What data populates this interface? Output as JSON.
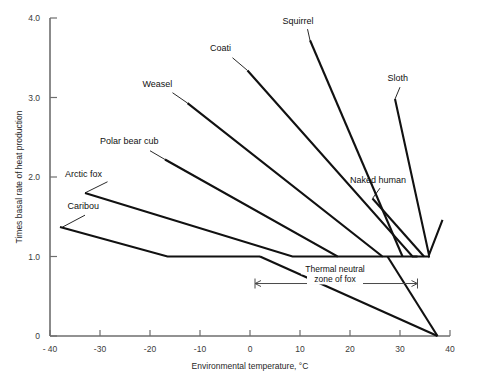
{
  "chart_data": {
    "type": "line",
    "title": "",
    "xlabel": "Environmental temperature, °C",
    "ylabel": "Times basal rate of heat production",
    "xlim": [
      -40,
      40
    ],
    "ylim": [
      0,
      4.0
    ],
    "xticks": [
      -40,
      -30,
      -20,
      -10,
      0,
      10,
      20,
      30,
      40
    ],
    "xticklabels": [
      "- 40",
      "-30",
      "-20",
      "-10",
      "0",
      "10",
      "20",
      "30",
      "40"
    ],
    "yticks": [
      0,
      1.0,
      2.0,
      3.0,
      4.0
    ],
    "yticklabels": [
      "0",
      "1.0",
      "2.0",
      "3.0",
      "4.0"
    ],
    "grid": false,
    "legend": "inline-labels",
    "series": [
      {
        "name": "Caribou",
        "label": "Caribou",
        "label_x": -36.5,
        "label_y": 1.6,
        "leader": [
          [
            -33.0,
            1.52
          ],
          [
            -37.5,
            1.37
          ]
        ],
        "points": [
          [
            -38.0,
            1.37
          ],
          [
            -16.5,
            1.0
          ],
          [
            2.0,
            1.0
          ]
        ]
      },
      {
        "name": "Arctic fox",
        "label": "Arctic fox",
        "label_x": -37.0,
        "label_y": 2.0,
        "leader": [
          [
            -28.5,
            1.94
          ],
          [
            -33.0,
            1.8
          ]
        ],
        "points": [
          [
            -33.0,
            1.8
          ],
          [
            8.5,
            1.0
          ],
          [
            17.5,
            1.0
          ]
        ]
      },
      {
        "name": "Polar bear cub",
        "label": "Polar bear cub",
        "label_x": -30.0,
        "label_y": 2.41,
        "leader": [
          [
            -20.0,
            2.33
          ],
          [
            -17.0,
            2.22
          ]
        ],
        "points": [
          [
            -17.0,
            2.22
          ],
          [
            17.5,
            1.0
          ],
          [
            26.5,
            1.0
          ]
        ]
      },
      {
        "name": "Weasel",
        "label": "Weasel",
        "label_x": -21.5,
        "label_y": 3.13,
        "leader": [
          [
            -15.5,
            3.06
          ],
          [
            -12.5,
            2.93
          ]
        ],
        "points": [
          [
            -12.5,
            2.93
          ],
          [
            26.5,
            1.0
          ],
          [
            33.5,
            1.0
          ]
        ]
      },
      {
        "name": "Coati",
        "label": "Coati",
        "label_x": -8.0,
        "label_y": 3.58,
        "leader": [
          [
            -3.5,
            3.5
          ],
          [
            -0.5,
            3.34
          ]
        ],
        "points": [
          [
            -0.5,
            3.34
          ],
          [
            32.5,
            1.0
          ],
          [
            36.0,
            1.0
          ]
        ]
      },
      {
        "name": "Squirrel",
        "label": "Squirrel",
        "label_x": 6.5,
        "label_y": 3.93,
        "leader": [
          [
            11.5,
            3.86
          ],
          [
            12.0,
            3.72
          ]
        ],
        "points": [
          [
            12.0,
            3.72
          ],
          [
            30.5,
            1.0
          ]
        ]
      },
      {
        "name": "Sloth",
        "label": "Sloth",
        "label_x": 27.5,
        "label_y": 3.21,
        "leader": [
          [
            30.0,
            3.13
          ],
          [
            29.0,
            2.98
          ]
        ],
        "points": [
          [
            29.0,
            2.98
          ],
          [
            35.8,
            1.02
          ],
          [
            38.5,
            1.46
          ]
        ]
      },
      {
        "name": "Naked human",
        "label": "Naked human",
        "label_x": 20.0,
        "label_y": 1.93,
        "leader": [
          [
            26.0,
            1.86
          ],
          [
            24.5,
            1.73
          ]
        ],
        "points": [
          [
            24.5,
            1.73
          ],
          [
            34.8,
            1.0
          ]
        ]
      },
      {
        "name": "Fox summit metabolism descent",
        "label": "",
        "points": [
          [
            2.0,
            1.0
          ],
          [
            37.5,
            0.0
          ]
        ]
      },
      {
        "name": "Fox lower descent",
        "label": "",
        "points": [
          [
            27.5,
            1.0
          ],
          [
            37.5,
            0.0
          ]
        ]
      }
    ],
    "annotations": [
      {
        "name": "thermal-neutral-zone",
        "text_line1": "Thermal neutral",
        "text_line2": "zone of fox",
        "arrow_from_x": 1.0,
        "arrow_to_x": 33.5,
        "arrow_y": 0.66,
        "text_x": 17.0,
        "text_y": 0.8
      }
    ]
  },
  "axis": {
    "x_title": "Environmental temperature, °C",
    "y_title": "Times basal rate of heat production"
  }
}
